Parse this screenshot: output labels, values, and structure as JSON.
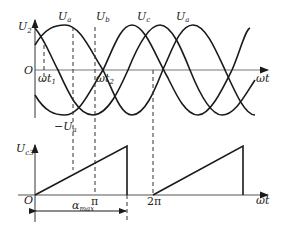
{
  "top_plot": {
    "y_axis_label": "U",
    "y_axis_sub": "2",
    "origin_label": "O",
    "x_axis_label": "ωt",
    "wave_labels": [
      {
        "main": "U",
        "sub": "a"
      },
      {
        "main": "U",
        "sub": "b"
      },
      {
        "main": "U",
        "sub": "c"
      },
      {
        "main": "U",
        "sub": "a"
      }
    ],
    "marker_labels": [
      {
        "main": "ωt",
        "sub": "1"
      },
      {
        "main": "ωt",
        "sub": "2"
      }
    ],
    "neg_label": {
      "prefix": "−U",
      "sub": "a"
    }
  },
  "bottom_plot": {
    "y_axis_label": "U",
    "y_axis_sub": "c3",
    "origin_label": "O",
    "x_axis_label": "ωt",
    "tick_labels": [
      "π",
      "2π"
    ],
    "alpha_label": {
      "main": "α",
      "sub": "max"
    }
  },
  "colors": {
    "line": "#1a1a1a",
    "axis": "#555555",
    "dash": "#333333"
  }
}
